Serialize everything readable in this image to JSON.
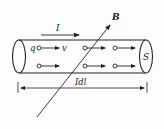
{
  "diagram": {
    "labels": {
      "current": "I",
      "field": "B",
      "charge": "q",
      "velocity": "v",
      "area": "S",
      "current_element": "Idl"
    },
    "charges": {
      "rows": 2,
      "per_row": 3
    },
    "colors": {
      "line": "#222222",
      "background": "#fdfdfd"
    }
  }
}
